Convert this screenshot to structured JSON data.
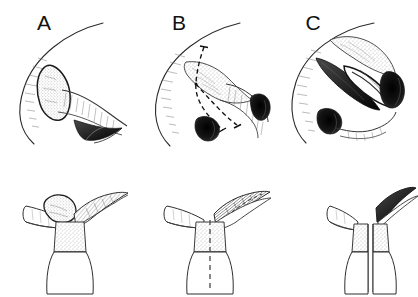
{
  "figure": {
    "background_color": "#ffffff",
    "ink_color": "#1a1a1a",
    "stipple_color": "#6e6e6e",
    "shadow_color": "#3a3a3a",
    "rows": 2,
    "columns": 3
  },
  "panels": [
    {
      "id": "a",
      "label": "A",
      "label_x": 44,
      "label_y": 30,
      "row": "top",
      "caption_text": "A",
      "stage": "Lesion in situ",
      "has_arc": true,
      "has_stippled_mass": true,
      "has_dashed_incision": false,
      "has_open_cavity": false
    },
    {
      "id": "b",
      "label": "B",
      "label_x": 179,
      "label_y": 30,
      "row": "top",
      "caption_text": "B",
      "stage": "Planned incision lines",
      "has_arc": true,
      "has_stippled_mass": true,
      "has_dashed_incision": true,
      "has_open_cavity": false
    },
    {
      "id": "c",
      "label": "C",
      "label_x": 313,
      "label_y": 30,
      "row": "top",
      "caption_text": "C",
      "stage": "Flap elevated, cavity exposed",
      "has_arc": true,
      "has_stippled_mass": true,
      "has_dashed_incision": false,
      "has_open_cavity": true
    }
  ],
  "cross_sections": [
    {
      "id": "a-section",
      "row": "bottom",
      "for_panel": "A",
      "stage": "Intact trunk with lesion on flap",
      "has_stippled_mass": true,
      "has_dashed_midline": false,
      "is_split": false
    },
    {
      "id": "b-section",
      "row": "bottom",
      "for_panel": "B",
      "stage": "Midline division marked",
      "has_stippled_mass": false,
      "has_dashed_midline": true,
      "is_split": false
    },
    {
      "id": "c-section",
      "row": "bottom",
      "for_panel": "C",
      "stage": "Trunk divided into two halves",
      "has_stippled_mass": false,
      "has_dashed_midline": false,
      "is_split": true
    }
  ]
}
